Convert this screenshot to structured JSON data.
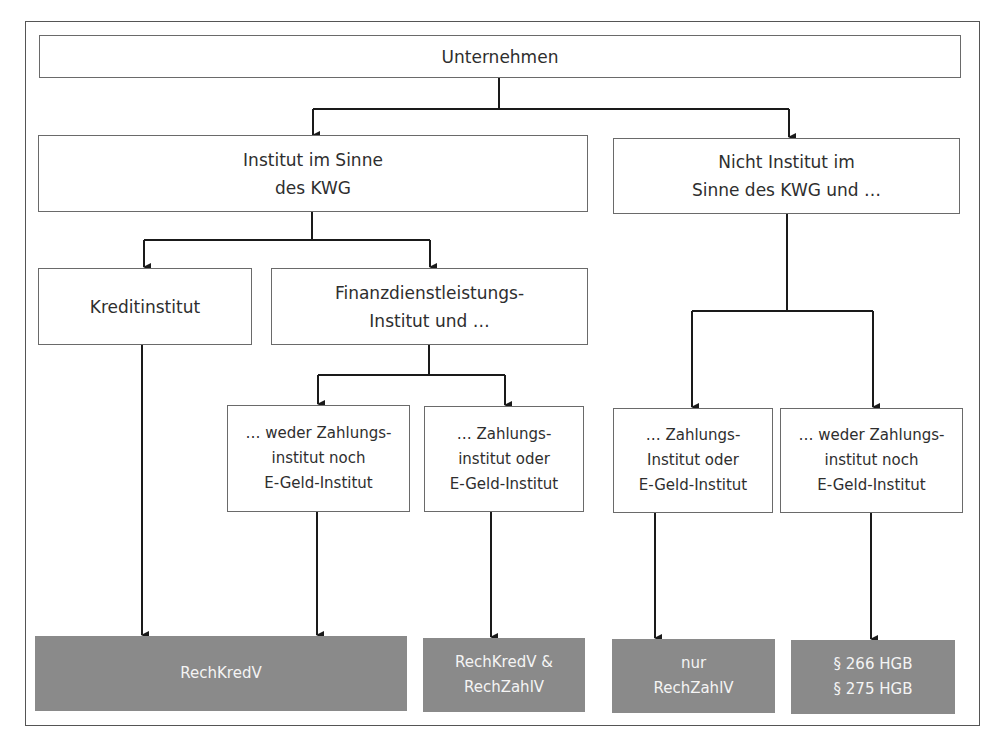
{
  "diagram": {
    "root": "Unternehmen",
    "level1": {
      "left": "Institut im Sinne\ndes KWG",
      "right": "Nicht Institut im\nSinne des KWG und …"
    },
    "level2": {
      "kredit": "Kreditinstitut",
      "finanz": "Finanzdienstleistungs-\nInstitut und …"
    },
    "level3": {
      "finanz_weder": "… weder Zahlungs-\ninstitut noch\nE-Geld-Institut",
      "finanz_zahlung": "… Zahlungs-\ninstitut oder\nE-Geld-Institut",
      "nicht_zahlung": "… Zahlungs-\nInstitut oder\nE-Geld-Institut",
      "nicht_weder": "… weder Zahlungs-\ninstitut noch\nE-Geld-Institut"
    },
    "outcomes": {
      "rechkredv": "RechKredV",
      "rechkredv_rechzahlv": "RechKredV &\nRechZahlV",
      "nur_rechzahlv": "nur\nRechZahlV",
      "hgb": "§ 266 HGB\n§ 275 HGB"
    },
    "colors": {
      "outcome_fill": "#8a8a8a",
      "outcome_text": "#f4f4f4",
      "line": "#1a1a1a",
      "box_border": "#6a6a6a"
    }
  }
}
